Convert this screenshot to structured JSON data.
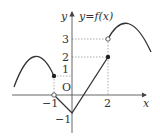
{
  "figure": {
    "function_label": "y=f(x)",
    "axes": {
      "x_label": "x",
      "y_label": "y",
      "origin_label": "O"
    },
    "x_ticks": [
      {
        "value": -1,
        "label": "−1"
      },
      {
        "value": 2,
        "label": "2"
      }
    ],
    "y_ticks": [
      {
        "value": 1,
        "label": "1"
      },
      {
        "value": 2,
        "label": "2"
      },
      {
        "value": 3,
        "label": "3"
      },
      {
        "value": -1,
        "label": "−1"
      }
    ],
    "key_points": [
      {
        "x": -1,
        "y": 1,
        "style": "filled"
      },
      {
        "x": -1,
        "y": 0,
        "style": "open"
      },
      {
        "x": 0,
        "y": -1,
        "style": "vertex"
      },
      {
        "x": 2,
        "y": 2,
        "style": "filled"
      },
      {
        "x": 2,
        "y": 3,
        "style": "open"
      }
    ],
    "colors": {
      "curve": "#333333",
      "axis": "#555555",
      "guide": "#999999"
    }
  }
}
